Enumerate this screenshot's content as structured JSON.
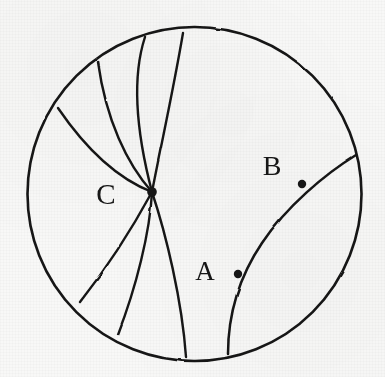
{
  "figure": {
    "type": "hand-drawn-geometry-diagram",
    "background_color": "#f8f8f7",
    "ink_color": "#151515",
    "canvas": {
      "width": 385,
      "height": 377
    }
  },
  "boundary_circle": {
    "name": "disk-boundary",
    "center_x": 194.5,
    "center_y": 194,
    "radius": 167,
    "stroke_width": 2.6
  },
  "points": [
    {
      "id": "A",
      "label": "A",
      "dot_x": 238,
      "dot_y": 274,
      "dot_radius": 4.2,
      "label_x": 205,
      "label_y": 280,
      "label_size": 27
    },
    {
      "id": "B",
      "label": "B",
      "dot_x": 302,
      "dot_y": 184,
      "dot_radius": 4.2,
      "label_x": 272,
      "label_y": 175,
      "label_size": 28
    },
    {
      "id": "C",
      "label": "C",
      "dot_x": 152,
      "dot_y": 192,
      "dot_radius": 4.8,
      "label_x": 106,
      "label_y": 204,
      "label_size": 29
    }
  ],
  "geodesics": [
    {
      "id": "geodesic-ab",
      "name": "geodesic-through-A-and-B",
      "passes_through": [
        "A",
        "B"
      ],
      "path": "M 228 354 C 228 320 237 280 262 243 C 286 207 325 174 356 155",
      "stroke_width": 2.5
    },
    {
      "id": "geodesic-c1",
      "name": "geodesic-C-to-top",
      "passes_through": [
        "C"
      ],
      "path": "M 152 192 C 160 150 173 92 183 33",
      "stroke_width": 2.4
    },
    {
      "id": "geodesic-c2",
      "name": "geodesic-C-to-upper-top-left",
      "passes_through": [
        "C"
      ],
      "path": "M 152 192 C 141 150 129 86 145 37",
      "stroke_width": 2.4
    },
    {
      "id": "geodesic-c3",
      "name": "geodesic-C-to-upper-left",
      "passes_through": [
        "C"
      ],
      "path": "M 152 192 C 127 164 106 120 98 62",
      "stroke_width": 2.4
    },
    {
      "id": "geodesic-c4",
      "name": "geodesic-C-to-left",
      "passes_through": [
        "C"
      ],
      "path": "M 152 192 C 121 180 88 152 58 108",
      "stroke_width": 2.4
    },
    {
      "id": "geodesic-c5",
      "name": "geodesic-C-to-lower-left",
      "passes_through": [
        "C"
      ],
      "path": "M 152 192 C 134 225 110 264 80 302",
      "stroke_width": 2.4
    },
    {
      "id": "geodesic-c6",
      "name": "geodesic-C-to-lower-left-lower",
      "passes_through": [
        "C"
      ],
      "path": "M 152 192 C 150 232 136 288 118 334",
      "stroke_width": 2.4
    },
    {
      "id": "geodesic-c7",
      "name": "geodesic-C-to-bottom",
      "passes_through": [
        "C"
      ],
      "path": "M 152 192 C 166 234 182 300 186 357",
      "stroke_width": 2.4
    }
  ]
}
